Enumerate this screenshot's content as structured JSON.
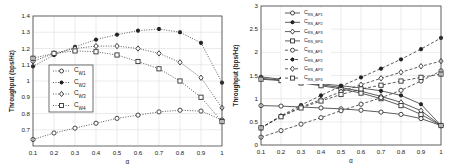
{
  "chart_data": [
    {
      "type": "line",
      "title": "",
      "xlabel": "α",
      "ylabel": "Throughput (bps/Hz)",
      "x": [
        0.1,
        0.2,
        0.3,
        0.4,
        0.5,
        0.6,
        0.7,
        0.8,
        0.9,
        1.0
      ],
      "xticks": [
        "0.1",
        "0.2",
        "0.3",
        "0.4",
        "0.5",
        "0.6",
        "0.7",
        "0.8",
        "0.9",
        "1"
      ],
      "yticks": [
        "0.7",
        "0.8",
        "0.9",
        "1",
        "1.1",
        "1.2",
        "1.3",
        "1.4"
      ],
      "xlim": [
        0.1,
        1.0
      ],
      "ylim": [
        0.6,
        1.4
      ],
      "grid": true,
      "legend_position": "center-left",
      "series": [
        {
          "name": "C_W1",
          "label_main": "C",
          "label_sub": "W1",
          "marker": "circle",
          "line": "dotted",
          "values": [
            0.64,
            0.68,
            0.71,
            0.74,
            0.77,
            0.79,
            0.81,
            0.82,
            0.815,
            0.76
          ]
        },
        {
          "name": "C_W2",
          "label_main": "C",
          "label_sub": "W2",
          "marker": "star",
          "line": "dotted",
          "values": [
            1.09,
            1.16,
            1.21,
            1.255,
            1.285,
            1.31,
            1.32,
            1.3,
            1.235,
            0.99
          ]
        },
        {
          "name": "C_W3",
          "label_main": "C",
          "label_sub": "W3",
          "marker": "diamond",
          "line": "dotted",
          "values": [
            1.12,
            1.17,
            1.2,
            1.215,
            1.215,
            1.2,
            1.17,
            1.115,
            1.02,
            0.835
          ]
        },
        {
          "name": "C_W4",
          "label_main": "C",
          "label_sub": "W4",
          "marker": "square",
          "line": "dotted",
          "values": [
            1.14,
            1.17,
            1.185,
            1.18,
            1.16,
            1.12,
            1.075,
            1.0,
            0.9,
            0.75
          ]
        }
      ]
    },
    {
      "type": "line",
      "title": "",
      "xlabel": "α",
      "ylabel": "Throughput (bps/Hz)",
      "x": [
        0.1,
        0.2,
        0.3,
        0.4,
        0.5,
        0.6,
        0.7,
        0.8,
        0.9,
        1.0
      ],
      "xticks": [
        "0.1",
        "0.2",
        "0.3",
        "0.4",
        "0.5",
        "0.6",
        "0.7",
        "0.8",
        "0.9",
        "1"
      ],
      "yticks": [
        "0",
        "0.5",
        "1",
        "1.5",
        "2",
        "2.5",
        "3"
      ],
      "xlim": [
        0.1,
        1.0
      ],
      "ylim": [
        0,
        3
      ],
      "grid": true,
      "legend_position": "upper-left",
      "series": [
        {
          "name": "C_RS_AP1",
          "label_main": "C",
          "label_sub": "RS_AP1",
          "marker": "circle",
          "line": "solid",
          "values": [
            0.85,
            0.84,
            0.82,
            0.8,
            0.78,
            0.75,
            0.71,
            0.66,
            0.57,
            0.42
          ]
        },
        {
          "name": "C_RS_AP2",
          "label_main": "C",
          "label_sub": "RS_AP2",
          "marker": "star",
          "line": "solid",
          "values": [
            1.47,
            1.42,
            1.37,
            1.32,
            1.28,
            1.23,
            1.17,
            1.07,
            0.88,
            0.42
          ]
        },
        {
          "name": "C_RS_AP3",
          "label_main": "C",
          "label_sub": "RS_AP3",
          "marker": "diamond",
          "line": "solid",
          "values": [
            1.44,
            1.4,
            1.35,
            1.3,
            1.24,
            1.16,
            1.05,
            0.92,
            0.74,
            0.42
          ]
        },
        {
          "name": "C_RS_BP4",
          "label_main": "C",
          "label_sub": "RS_BP4",
          "marker": "square",
          "line": "solid",
          "values": [
            1.42,
            1.39,
            1.34,
            1.28,
            1.21,
            1.12,
            1.0,
            0.85,
            0.66,
            0.42
          ]
        },
        {
          "name": "C_RS_AP1",
          "label_main": "C",
          "label_sub": "RS_AP1",
          "marker": "circle",
          "line": "dashed",
          "values": [
            0.17,
            0.31,
            0.45,
            0.59,
            0.74,
            0.88,
            1.02,
            1.18,
            1.38,
            1.6
          ]
        },
        {
          "name": "C_RS_AP2",
          "label_main": "C",
          "label_sub": "RS_AP2",
          "marker": "star",
          "line": "dashed",
          "values": [
            0.37,
            0.63,
            0.86,
            1.07,
            1.27,
            1.46,
            1.65,
            1.85,
            2.07,
            2.31
          ]
        },
        {
          "name": "C_RS_AP3",
          "label_main": "C",
          "label_sub": "RS_AP3",
          "marker": "diamond",
          "line": "dashed",
          "values": [
            0.37,
            0.62,
            0.82,
            0.98,
            1.15,
            1.3,
            1.44,
            1.57,
            1.7,
            1.81
          ]
        },
        {
          "name": "C_RS_BP4",
          "label_main": "C",
          "label_sub": "RS_BP4",
          "marker": "square",
          "line": "dashed",
          "values": [
            0.37,
            0.61,
            0.8,
            0.95,
            1.09,
            1.21,
            1.29,
            1.38,
            1.46,
            1.53
          ]
        }
      ]
    }
  ],
  "colors": {
    "line": "#333333",
    "grid": "#e3e3e3",
    "axis": "#444444",
    "marker_fill": "#ffffff",
    "marker_dark": "#222222"
  }
}
